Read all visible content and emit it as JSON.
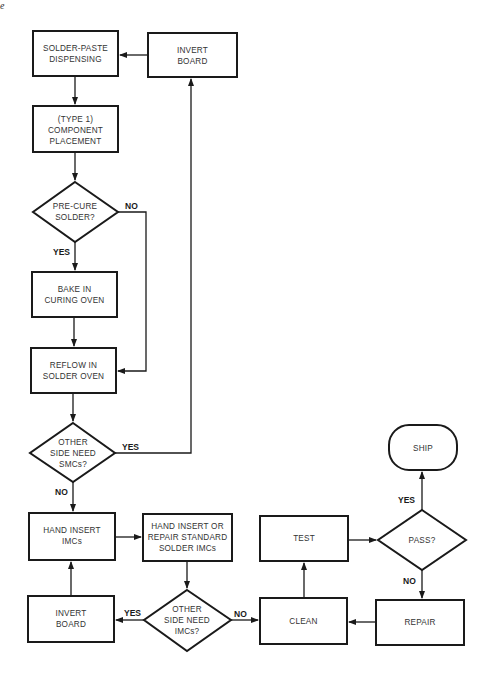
{
  "corner_mark": "e",
  "nodes": {
    "solder_paste": {
      "lines": [
        "SOLDER-PASTE",
        "DISPENSING"
      ]
    },
    "invert_board_top": {
      "lines": [
        "INVERT",
        "BOARD"
      ]
    },
    "component_placement": {
      "lines": [
        "(TYPE 1)",
        "COMPONENT",
        "PLACEMENT"
      ]
    },
    "pre_cure": {
      "lines": [
        "PRE-CURE",
        "SOLDER?"
      ]
    },
    "bake": {
      "lines": [
        "BAKE IN",
        "CURING OVEN"
      ]
    },
    "reflow": {
      "lines": [
        "REFLOW IN",
        "SOLDER OVEN"
      ]
    },
    "other_side_smc": {
      "lines": [
        "OTHER",
        "SIDE NEED",
        "SMCs?"
      ]
    },
    "hand_insert": {
      "lines": [
        "HAND INSERT",
        "IMCs"
      ]
    },
    "hand_insert_repair": {
      "lines": [
        "HAND INSERT OR",
        "REPAIR STANDARD",
        "SOLDER IMCs"
      ]
    },
    "invert_board_bottom": {
      "lines": [
        "INVERT",
        "BOARD"
      ]
    },
    "other_side_imc": {
      "lines": [
        "OTHER",
        "SIDE NEED",
        "IMCs?"
      ]
    },
    "clean": {
      "lines": [
        "CLEAN"
      ]
    },
    "test": {
      "lines": [
        "TEST"
      ]
    },
    "pass": {
      "lines": [
        "PASS?"
      ]
    },
    "repair": {
      "lines": [
        "REPAIR"
      ]
    },
    "ship": {
      "lines": [
        "SHIP"
      ]
    }
  },
  "edge_labels": {
    "pre_cure_no": "NO",
    "pre_cure_yes": "YES",
    "smc_yes": "YES",
    "smc_no": "NO",
    "imc_yes": "YES",
    "imc_no": "NO",
    "pass_yes": "YES",
    "pass_no": "NO"
  }
}
